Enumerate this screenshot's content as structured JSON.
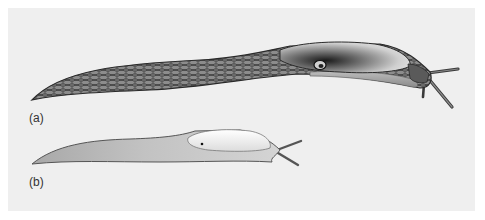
{
  "figure": {
    "background_color": "#efefef",
    "panels": [
      {
        "id": "a",
        "label": "(a)",
        "subject": "slug with large mantle, reticulated (net-patterned) dark body",
        "body_color": "#5a5a5a",
        "mantle_color": "#d8d8d8"
      },
      {
        "id": "b",
        "label": "(b)",
        "subject": "slug with smaller mantle, pale smooth body",
        "body_color": "#c4c4c4",
        "mantle_color": "#f4f4f4"
      }
    ]
  }
}
